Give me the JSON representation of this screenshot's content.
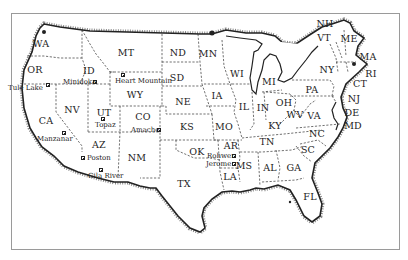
{
  "map": {
    "title": "",
    "frame_color": "#9a9a9a",
    "ink_color": "#222222",
    "states": [
      {
        "abbr": "WA",
        "x": 41,
        "y": 44
      },
      {
        "abbr": "OR",
        "x": 35,
        "y": 70
      },
      {
        "abbr": "ID",
        "x": 89,
        "y": 71
      },
      {
        "abbr": "MT",
        "x": 126,
        "y": 53
      },
      {
        "abbr": "WY",
        "x": 135,
        "y": 95
      },
      {
        "abbr": "ND",
        "x": 178,
        "y": 53
      },
      {
        "abbr": "SD",
        "x": 177,
        "y": 78
      },
      {
        "abbr": "NE",
        "x": 183,
        "y": 102
      },
      {
        "abbr": "KS",
        "x": 187,
        "y": 127
      },
      {
        "abbr": "OK",
        "x": 197,
        "y": 152
      },
      {
        "abbr": "TX",
        "x": 184,
        "y": 184
      },
      {
        "abbr": "NV",
        "x": 72,
        "y": 110
      },
      {
        "abbr": "UT",
        "x": 104,
        "y": 113
      },
      {
        "abbr": "CO",
        "x": 143,
        "y": 117
      },
      {
        "abbr": "CA",
        "x": 46,
        "y": 121
      },
      {
        "abbr": "AZ",
        "x": 99,
        "y": 145
      },
      {
        "abbr": "NM",
        "x": 137,
        "y": 158
      },
      {
        "abbr": "MN",
        "x": 208,
        "y": 54
      },
      {
        "abbr": "WI",
        "x": 237,
        "y": 74
      },
      {
        "abbr": "IA",
        "x": 217,
        "y": 96
      },
      {
        "abbr": "MO",
        "x": 224,
        "y": 127
      },
      {
        "abbr": "AR",
        "x": 231,
        "y": 146
      },
      {
        "abbr": "LA",
        "x": 230,
        "y": 177
      },
      {
        "abbr": "MS",
        "x": 244,
        "y": 166
      },
      {
        "abbr": "IL",
        "x": 244,
        "y": 107
      },
      {
        "abbr": "IN",
        "x": 263,
        "y": 108
      },
      {
        "abbr": "MI",
        "x": 269,
        "y": 82
      },
      {
        "abbr": "OH",
        "x": 284,
        "y": 103
      },
      {
        "abbr": "KY",
        "x": 275,
        "y": 126
      },
      {
        "abbr": "TN",
        "x": 267,
        "y": 142
      },
      {
        "abbr": "AL",
        "x": 270,
        "y": 168
      },
      {
        "abbr": "GA",
        "x": 294,
        "y": 168
      },
      {
        "abbr": "FL",
        "x": 310,
        "y": 197
      },
      {
        "abbr": "SC",
        "x": 308,
        "y": 150
      },
      {
        "abbr": "NC",
        "x": 317,
        "y": 134
      },
      {
        "abbr": "VA",
        "x": 314,
        "y": 116
      },
      {
        "abbr": "WV",
        "x": 295,
        "y": 115
      },
      {
        "abbr": "PA",
        "x": 312,
        "y": 90
      },
      {
        "abbr": "NY",
        "x": 327,
        "y": 70
      },
      {
        "abbr": "NH",
        "x": 325,
        "y": 24
      },
      {
        "abbr": "VT",
        "x": 324,
        "y": 38
      },
      {
        "abbr": "ME",
        "x": 349,
        "y": 39
      },
      {
        "abbr": "MA",
        "x": 368,
        "y": 57
      },
      {
        "abbr": "RI",
        "x": 371,
        "y": 74
      },
      {
        "abbr": "CT",
        "x": 360,
        "y": 84
      },
      {
        "abbr": "NJ",
        "x": 354,
        "y": 99
      },
      {
        "abbr": "DE",
        "x": 352,
        "y": 113
      },
      {
        "abbr": "MD",
        "x": 353,
        "y": 126
      }
    ],
    "camps": [
      {
        "name": "Tule Lake",
        "label_x": 8,
        "label_y": 88,
        "mark_x": 48,
        "mark_y": 85
      },
      {
        "name": "Minidoka",
        "label_x": 64,
        "label_y": 82,
        "mark_x": 95,
        "mark_y": 82
      },
      {
        "name": "Heart Mountain",
        "label_x": 115,
        "label_y": 81,
        "mark_x": 123,
        "mark_y": 75
      },
      {
        "name": "Topaz",
        "label_x": 95,
        "label_y": 124,
        "mark_x": 103,
        "mark_y": 119
      },
      {
        "name": "Amache",
        "label_x": 131,
        "label_y": 130,
        "mark_x": 159,
        "mark_y": 130
      },
      {
        "name": "Manzanar",
        "label_x": 38,
        "label_y": 137,
        "mark_x": 64,
        "mark_y": 133
      },
      {
        "name": "Poston",
        "label_x": 87,
        "label_y": 158,
        "mark_x": 83,
        "mark_y": 158
      },
      {
        "name": "Gila River",
        "label_x": 88,
        "label_y": 174,
        "mark_x": 101,
        "mark_y": 169
      },
      {
        "name": "Rohwer",
        "label_x": 207,
        "label_y": 154,
        "mark_x": 233,
        "mark_y": 156
      },
      {
        "name": "Jerome",
        "label_x": 207,
        "label_y": 163,
        "mark_x": 233,
        "mark_y": 164
      }
    ]
  }
}
